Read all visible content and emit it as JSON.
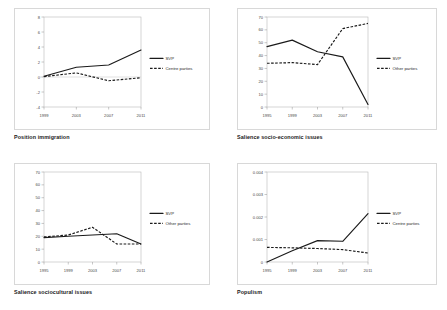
{
  "page": {
    "background": "#ffffff",
    "line_color": "#1a1a1a",
    "axis_color": "#8c8c8c"
  },
  "chart_data": [
    {
      "id": "position-immigration",
      "type": "line",
      "title": "Position immigration",
      "xlabel": "",
      "ylabel": "",
      "x": [
        "1999",
        "2003",
        "2007",
        "2011"
      ],
      "ylim": [
        -4,
        8
      ],
      "yticks": [
        "-4",
        "-2",
        "0",
        "2",
        "4",
        "6",
        "8"
      ],
      "ytick_values": [
        -4,
        -2,
        0,
        2,
        4,
        6,
        8
      ],
      "grid": false,
      "zero_line": true,
      "legend_position": "right",
      "series": [
        {
          "name": "SVP",
          "style": "solid",
          "values": [
            0.1,
            1.3,
            1.6,
            3.6
          ]
        },
        {
          "name": "Centre parties",
          "style": "dashed",
          "values": [
            0.05,
            0.55,
            -0.5,
            -0.1
          ]
        }
      ]
    },
    {
      "id": "salience-socio-economic-issues",
      "type": "line",
      "title": "Salience socio-economic issues",
      "xlabel": "",
      "ylabel": "",
      "x": [
        "1995",
        "1999",
        "2003",
        "2007",
        "2011"
      ],
      "ylim": [
        0,
        70
      ],
      "yticks": [
        "0",
        "10",
        "20",
        "30",
        "40",
        "50",
        "60",
        "70"
      ],
      "ytick_values": [
        0,
        10,
        20,
        30,
        40,
        50,
        60,
        70
      ],
      "grid": false,
      "zero_line": false,
      "legend_position": "right",
      "series": [
        {
          "name": "SVP",
          "style": "solid",
          "values": [
            47,
            52,
            43,
            39,
            2
          ]
        },
        {
          "name": "Other parties",
          "style": "dashed",
          "values": [
            34,
            34.5,
            33,
            61,
            65
          ]
        }
      ]
    },
    {
      "id": "salience-sociocultural-issues",
      "type": "line",
      "title": "Salience sociocultural issues",
      "xlabel": "",
      "ylabel": "",
      "x": [
        "1995",
        "1999",
        "2003",
        "2007",
        "2011"
      ],
      "ylim": [
        0,
        70
      ],
      "yticks": [
        "0",
        "10",
        "20",
        "30",
        "40",
        "50",
        "60",
        "70"
      ],
      "ytick_values": [
        0,
        10,
        20,
        30,
        40,
        50,
        60,
        70
      ],
      "grid": false,
      "zero_line": false,
      "legend_position": "right",
      "series": [
        {
          "name": "SVP",
          "style": "solid",
          "values": [
            19,
            20,
            21,
            22,
            14
          ]
        },
        {
          "name": "Other parties",
          "style": "dashed",
          "values": [
            19.5,
            21,
            27,
            14,
            14
          ]
        }
      ]
    },
    {
      "id": "populism",
      "type": "line",
      "title": "Populism",
      "xlabel": "",
      "ylabel": "",
      "x": [
        "1995",
        "1999",
        "2003",
        "2007",
        "2011"
      ],
      "ylim": [
        0,
        0.004
      ],
      "yticks": [
        "0",
        "0.001",
        "0.002",
        "0.003",
        "0.004"
      ],
      "ytick_values": [
        0,
        0.001,
        0.002,
        0.003,
        0.004
      ],
      "grid": false,
      "zero_line": false,
      "legend_position": "right",
      "series": [
        {
          "name": "SVP",
          "style": "solid",
          "values": [
            0,
            0.0005,
            0.00095,
            0.00092,
            0.00215
          ]
        },
        {
          "name": "Centre parties",
          "style": "dashed",
          "values": [
            0.00065,
            0.00063,
            0.0006,
            0.00055,
            0.0004
          ]
        }
      ]
    }
  ]
}
